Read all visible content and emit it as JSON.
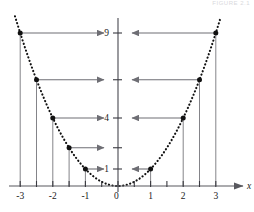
{
  "figure": {
    "caption_top_right": "FIGURE 2.1",
    "axis_x_label": "x",
    "origin_label": "0"
  },
  "chart_data": {
    "type": "scatter",
    "title": "",
    "subtitle": "",
    "xlabel": "x",
    "ylabel": "",
    "function": "y = x^2",
    "curve_style": "dotted",
    "xlim": [
      -3.45,
      3.45
    ],
    "ylim": [
      -0.45,
      9.9
    ],
    "grid": false,
    "legend": false,
    "x_ticks": [
      -3,
      -2.5,
      -2,
      -1.5,
      -1,
      -0.5,
      0,
      0.5,
      1,
      1.5,
      2,
      2.5,
      3
    ],
    "x_tick_labels": [
      "-3",
      "",
      "-2",
      "",
      "-1",
      "",
      "0",
      "",
      "1",
      "",
      "2",
      "",
      "3"
    ],
    "y_ticks": [
      1,
      2.25,
      4,
      6.25,
      9
    ],
    "y_tick_labels": [
      "1",
      "",
      "4",
      "",
      "9"
    ],
    "points": [
      {
        "x": -3,
        "y": 9,
        "label": ""
      },
      {
        "x": -2.5,
        "y": 6.25,
        "label": ""
      },
      {
        "x": -2,
        "y": 4,
        "label": ""
      },
      {
        "x": -1.5,
        "y": 2.25,
        "label": ""
      },
      {
        "x": -1,
        "y": 1,
        "label": ""
      },
      {
        "x": 1,
        "y": 1,
        "label": ""
      },
      {
        "x": 2,
        "y": 4,
        "label": ""
      },
      {
        "x": 2.5,
        "y": 6.25,
        "label": ""
      },
      {
        "x": 3,
        "y": 9,
        "label": ""
      }
    ],
    "drop_lines": [
      -3,
      -2.5,
      -2,
      -1.5,
      -1,
      1,
      2,
      2.5,
      3
    ],
    "arrows": [
      {
        "from_x": -3,
        "y": 9,
        "direction": "right"
      },
      {
        "from_x": -2.5,
        "y": 6.25,
        "direction": "right"
      },
      {
        "from_x": -2,
        "y": 4,
        "direction": "right"
      },
      {
        "from_x": -1.5,
        "y": 2.25,
        "direction": "right"
      },
      {
        "from_x": -1,
        "y": 1,
        "direction": "right"
      },
      {
        "from_x": 1,
        "y": 1,
        "direction": "left"
      },
      {
        "from_x": 2,
        "y": 4,
        "direction": "left"
      },
      {
        "from_x": 2.5,
        "y": 6.25,
        "direction": "left"
      },
      {
        "from_x": 3,
        "y": 9,
        "direction": "left"
      }
    ],
    "colors": {
      "axis": "#58585e",
      "curve": "#111111",
      "point": "#111111",
      "arrow": "#6e6e74",
      "drop_line": "#6e6e74",
      "background": "#ffffff"
    }
  }
}
